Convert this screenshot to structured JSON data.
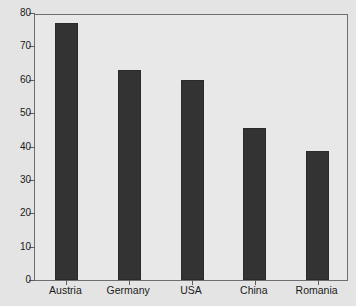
{
  "chart_data": {
    "type": "bar",
    "title": "",
    "subtitle": "",
    "xlabel": "",
    "ylabel": "",
    "categories": [
      "Austria",
      "Germany",
      "USA",
      "China",
      "Romania"
    ],
    "values": [
      77,
      63,
      60,
      45.5,
      38.7
    ],
    "series": [
      {
        "name": "",
        "values": [
          77,
          63,
          60,
          45.5,
          38.7
        ]
      }
    ],
    "ylim": [
      0,
      80
    ],
    "yticks": [
      0,
      10,
      20,
      30,
      40,
      50,
      60,
      70,
      80
    ],
    "ytick_labels": [
      "0",
      "10",
      "20",
      "30",
      "40",
      "50",
      "60",
      "70",
      "80"
    ],
    "grid": false,
    "legend": false,
    "legend_position": "none",
    "annotations": []
  },
  "style": {
    "bar_color": "#333333",
    "plot_background": "#e8e8e8",
    "figure_background": "#e4e4e4",
    "axis_color": "#6e6e6e",
    "text_color": "#1a1a1a"
  }
}
